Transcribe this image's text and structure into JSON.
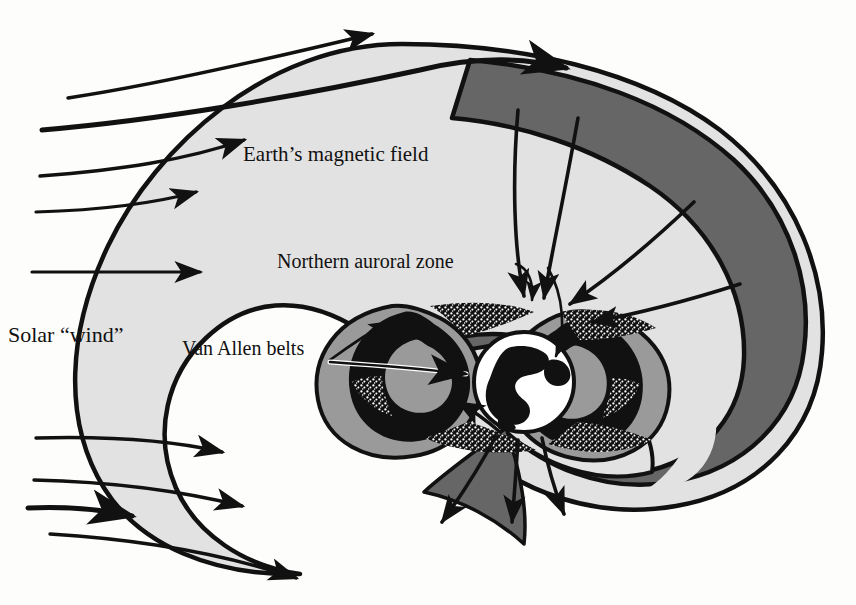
{
  "figure": {
    "kind": "scientific-diagram",
    "background_color": "#fdfdfb"
  },
  "labels": {
    "solar_wind": "Solar “wind”",
    "earth_magnetic_field": "Earth’s magnetic field",
    "northern_auroral_zone": "Northern auroral zone",
    "van_allen_belts": "Van Allen belts"
  },
  "palette": {
    "ink": "#111111",
    "magnetosphere_light": "#e2e2e2",
    "magnetotail_dark": "#666666",
    "belt_mid": "#9a9a9a",
    "white": "#ffffff",
    "paper": "#fdfdfb"
  },
  "regions": [
    {
      "name": "magnetosheath-outer-light",
      "fill": "#e2e2e2"
    },
    {
      "name": "magnetotail-dark-lobe",
      "fill": "#666666"
    },
    {
      "name": "inner-light-lobe",
      "fill": "#e2e2e2"
    },
    {
      "name": "van-allen-belt-lobes",
      "fill": "#111111"
    },
    {
      "name": "earth-globe",
      "fill": "#ffffff"
    }
  ],
  "solar_wind_streamlines": [
    {
      "name": "streamline-1",
      "deflected": true
    },
    {
      "name": "streamline-2",
      "deflected": true
    },
    {
      "name": "streamline-3",
      "deflected": false
    },
    {
      "name": "streamline-4",
      "deflected": false
    },
    {
      "name": "streamline-5",
      "deflected": false
    },
    {
      "name": "streamline-6",
      "deflected": true
    },
    {
      "name": "streamline-7",
      "deflected": true
    },
    {
      "name": "streamline-8",
      "deflected": true
    }
  ],
  "field_lines": {
    "northern_inflow_count": 4,
    "southern_outflow_count": 4,
    "direction": "toward polar cusps"
  }
}
